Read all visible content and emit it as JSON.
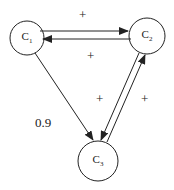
{
  "diagram": {
    "nodes": [
      {
        "id": "C1",
        "base": "C",
        "sub": "1",
        "cx": 27,
        "cy": 38,
        "r": 17
      },
      {
        "id": "C2",
        "base": "C",
        "sub": "2",
        "cx": 147,
        "cy": 36,
        "r": 18
      },
      {
        "id": "C3",
        "base": "C",
        "sub": "3",
        "cx": 98,
        "cy": 161,
        "r": 20
      }
    ],
    "edges": [
      {
        "from": "C1",
        "to": "C2",
        "label": "+"
      },
      {
        "from": "C2",
        "to": "C1",
        "label": "+"
      },
      {
        "from": "C1",
        "to": "C3",
        "label": "0.9"
      },
      {
        "from": "C2",
        "to": "C3",
        "label": "+"
      },
      {
        "from": "C3",
        "to": "C2",
        "label": "+"
      }
    ],
    "labels": {
      "top_plus": "+",
      "middle_plus": "+",
      "inner_plus": "+",
      "right_plus": "+",
      "weight": "0.9"
    }
  },
  "colors": {
    "stroke": "#222222",
    "background": "#ffffff"
  }
}
